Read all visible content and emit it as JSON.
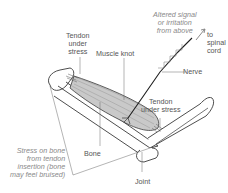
{
  "diagram": {
    "colors": {
      "outline": "#3a3a3a",
      "muscle_fill": "#c9c9c9",
      "nerve": "#1e1e1e",
      "label_text": "#555555",
      "italic_label_text": "#8a8a8a",
      "background": "#ffffff"
    },
    "labels": {
      "altered_signal": [
        "Altered signal",
        "or irritation",
        "from above"
      ],
      "to_spinal_cord": [
        "to",
        "spinal",
        "cord"
      ],
      "tendon_top_left": [
        "Tendon",
        "under",
        "stress"
      ],
      "muscle_knot": "Muscle knot",
      "nerve": "Nerve",
      "tendon_right": [
        "Tendon",
        "under stress"
      ],
      "bone": "Bone",
      "stress_on_bone": [
        "Stress on bone",
        "from tendon",
        "insertion (bone",
        "may feel bruised)"
      ],
      "joint": "Joint"
    }
  }
}
